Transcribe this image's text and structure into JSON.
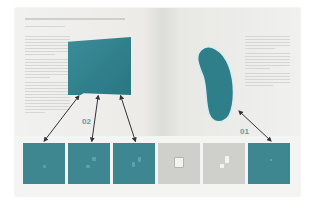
{
  "spread": {
    "left_page": {
      "title_visible": true,
      "text_lines_left_column": 30
    },
    "right_page": {
      "text_lines_right_column": 18
    }
  },
  "figures": {
    "teal_square_color": "#2f7f8b",
    "teal_bean_color": "#2f7f8b"
  },
  "callouts": [
    {
      "label": "02",
      "target": "teal-square"
    },
    {
      "label": "01",
      "target": "teal-bean"
    }
  ],
  "thumbnails": [
    {
      "type": "teal",
      "color": "#3e8790"
    },
    {
      "type": "teal",
      "color": "#3e8790"
    },
    {
      "type": "teal",
      "color": "#3e8790"
    },
    {
      "type": "grey",
      "color": "#cfcfcb"
    },
    {
      "type": "grey",
      "color": "#cfcfcb"
    },
    {
      "type": "teal",
      "color": "#3e8790"
    }
  ]
}
